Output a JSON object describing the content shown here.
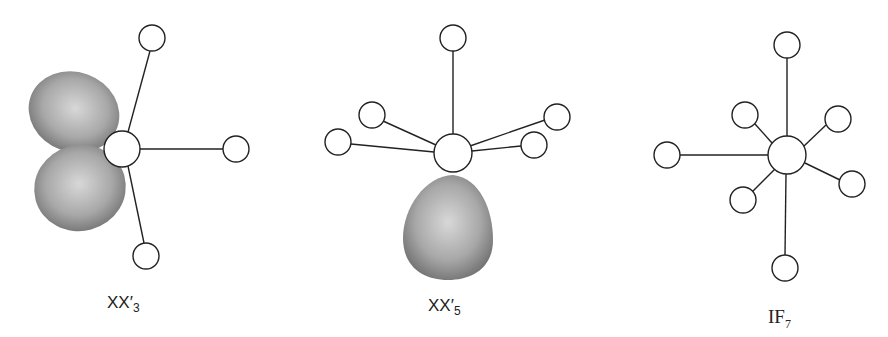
{
  "figure": {
    "molecules": [
      {
        "id": "xx3",
        "label_main": "XX′",
        "label_sub": "3",
        "description": "T-shaped molecule with two lone pairs"
      },
      {
        "id": "xx5",
        "label_main": "XX′",
        "label_sub": "5",
        "description": "Square pyramidal molecule with one lone pair"
      },
      {
        "id": "if7",
        "label_main": "IF",
        "label_sub": "7",
        "description": "Pentagonal bipyramidal molecule"
      }
    ]
  },
  "colors": {
    "bond": "#222222",
    "atom_fill": "#ffffff",
    "lone_pair": "#8a8a8a"
  }
}
